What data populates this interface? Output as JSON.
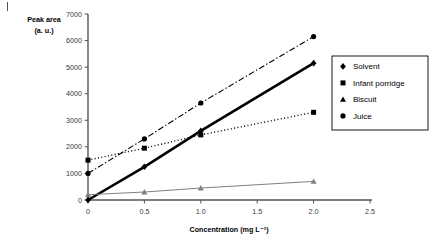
{
  "chart_data": {
    "type": "line",
    "title": "",
    "xlabel": "Concentration (mg L⁻¹)",
    "ylabel": "Peak area (a. u.)",
    "ylabel_line1": "Peak area",
    "ylabel_line2": "(a. u.)",
    "xlim": [
      0,
      2.5
    ],
    "ylim": [
      0,
      7000
    ],
    "xticks": [
      "0",
      "0.5",
      "1.0",
      "1.5",
      "2.0",
      "2.5"
    ],
    "xtick_values": [
      0,
      0.5,
      1.0,
      1.5,
      2.0,
      2.5
    ],
    "yticks": [
      "0",
      "1000",
      "2000",
      "3000",
      "4000",
      "5000",
      "6000",
      "7000"
    ],
    "ytick_values": [
      0,
      1000,
      2000,
      3000,
      4000,
      5000,
      6000,
      7000
    ],
    "grid": false,
    "legend_position": "right",
    "x": [
      0,
      0.5,
      1.0,
      2.0
    ],
    "series": [
      {
        "name": "Solvent",
        "marker": "diamond",
        "linestyle": "solid",
        "color": "#000000",
        "linewidth": 2.6,
        "values": [
          0,
          1250,
          2600,
          5150
        ]
      },
      {
        "name": "Infant porridge",
        "marker": "square",
        "linestyle": "dotted",
        "color": "#000000",
        "linewidth": 1.4,
        "values": [
          1500,
          1950,
          2450,
          3300
        ]
      },
      {
        "name": "Biscuit",
        "marker": "triangle",
        "linestyle": "solid",
        "color": "#808080",
        "linewidth": 1.0,
        "values": [
          200,
          300,
          450,
          700
        ]
      },
      {
        "name": "Juice",
        "marker": "circle",
        "linestyle": "dashdot",
        "color": "#000000",
        "linewidth": 1.1,
        "values": [
          1000,
          2300,
          3650,
          6150
        ]
      }
    ]
  },
  "legend": {
    "items": [
      {
        "label": "Solvent",
        "glyph": "◆",
        "icon": "diamond-marker-icon"
      },
      {
        "label": "Infant porridge",
        "glyph": "■",
        "icon": "square-marker-icon"
      },
      {
        "label": "Biscuit",
        "glyph": "▲",
        "icon": "triangle-marker-icon"
      },
      {
        "label": "Juice",
        "glyph": "●",
        "icon": "circle-marker-icon"
      }
    ]
  }
}
